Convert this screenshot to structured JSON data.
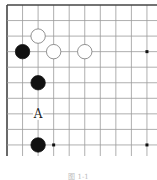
{
  "board": {
    "columns_visible": 10,
    "rows_visible": 10,
    "edges": [
      "top",
      "left"
    ],
    "stones": [
      {
        "color": "white",
        "col": 2,
        "row": 2
      },
      {
        "color": "black",
        "col": 1,
        "row": 3
      },
      {
        "color": "white",
        "col": 3,
        "row": 3
      },
      {
        "color": "white",
        "col": 5,
        "row": 3
      },
      {
        "color": "black",
        "col": 2,
        "row": 5
      },
      {
        "color": "black",
        "col": 2,
        "row": 9
      }
    ],
    "labels": [
      {
        "text": "A",
        "col": 2,
        "row": 7
      }
    ],
    "star_points": [
      {
        "col": 9,
        "row": 3
      },
      {
        "col": 3,
        "row": 9
      },
      {
        "col": 9,
        "row": 9
      }
    ]
  },
  "caption": "图 1-1"
}
